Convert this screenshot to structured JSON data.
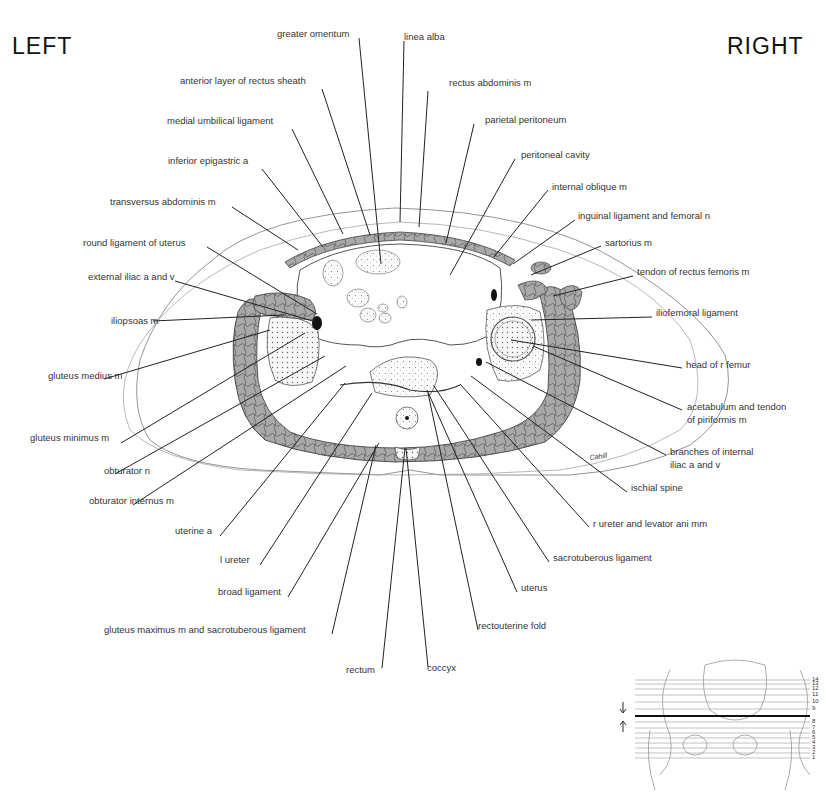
{
  "orientation": {
    "left": "LEFT",
    "right": "RIGHT"
  },
  "signature": "Cahill",
  "labels": [
    {
      "text": "greater omentum",
      "x": 277,
      "y": 34
    },
    {
      "text": "linea alba",
      "x": 404,
      "y": 37
    },
    {
      "text": "anterior layer of rectus sheath",
      "x": 180,
      "y": 81
    },
    {
      "text": "rectus abdominis m",
      "x": 449,
      "y": 83
    },
    {
      "text": "medial umbilical ligament",
      "x": 167,
      "y": 121
    },
    {
      "text": "parietal peritoneum",
      "x": 485,
      "y": 120
    },
    {
      "text": "inferior epigastric a",
      "x": 168,
      "y": 161
    },
    {
      "text": "peritoneal cavity",
      "x": 521,
      "y": 155
    },
    {
      "text": "internal oblique m",
      "x": 552,
      "y": 187
    },
    {
      "text": "transversus abdominis m",
      "x": 110,
      "y": 202
    },
    {
      "text": "inguinal ligament and femoral n",
      "x": 578,
      "y": 216
    },
    {
      "text": "sartorius m",
      "x": 605,
      "y": 243
    },
    {
      "text": "round ligament of uterus",
      "x": 83,
      "y": 243
    },
    {
      "text": "external iliac a and v",
      "x": 88,
      "y": 277
    },
    {
      "text": "tendon of rectus femoris m",
      "x": 637,
      "y": 272
    },
    {
      "text": "iliopsoas m",
      "x": 111,
      "y": 321
    },
    {
      "text": "iliofemoral ligament",
      "x": 656,
      "y": 313
    },
    {
      "text": "head of r femur",
      "x": 686,
      "y": 365
    },
    {
      "text": "gluteus medius m",
      "x": 48,
      "y": 376
    },
    {
      "text": "acetabulum and tendon",
      "x": 687,
      "y": 407
    },
    {
      "text": "of piriformis m",
      "x": 687,
      "y": 420
    },
    {
      "text": "branches of internal",
      "x": 670,
      "y": 452
    },
    {
      "text": "iliac a and v",
      "x": 670,
      "y": 465
    },
    {
      "text": "gluteus minimus m",
      "x": 30,
      "y": 438
    },
    {
      "text": "obturator n",
      "x": 104,
      "y": 471
    },
    {
      "text": "ischial spine",
      "x": 631,
      "y": 488
    },
    {
      "text": "obturator internus m",
      "x": 89,
      "y": 501
    },
    {
      "text": "r ureter and levator ani mm",
      "x": 593,
      "y": 524
    },
    {
      "text": "uterine a",
      "x": 175,
      "y": 531
    },
    {
      "text": "sacrotuberous ligament",
      "x": 553,
      "y": 558
    },
    {
      "text": "l ureter",
      "x": 220,
      "y": 560
    },
    {
      "text": "uterus",
      "x": 521,
      "y": 588
    },
    {
      "text": "broad ligament",
      "x": 218,
      "y": 592
    },
    {
      "text": "rectouterine fold",
      "x": 478,
      "y": 626
    },
    {
      "text": "gluteus maximus m and sacrotuberous ligament",
      "x": 104,
      "y": 630
    },
    {
      "text": "rectum",
      "x": 346,
      "y": 670
    },
    {
      "text": "coccyx",
      "x": 427,
      "y": 668
    }
  ],
  "leaders": [
    [
      359,
      38,
      381,
      264
    ],
    [
      404,
      41,
      400,
      222
    ],
    [
      322,
      89,
      370,
      235
    ],
    [
      428,
      91,
      419,
      227
    ],
    [
      292,
      129,
      343,
      234
    ],
    [
      474,
      124,
      446,
      243
    ],
    [
      262,
      169,
      323,
      247
    ],
    [
      515,
      159,
      450,
      275
    ],
    [
      548,
      190,
      494,
      257
    ],
    [
      232,
      207,
      298,
      250
    ],
    [
      575,
      220,
      513,
      264
    ],
    [
      601,
      246,
      531,
      275
    ],
    [
      207,
      247,
      317,
      314
    ],
    [
      175,
      281,
      316,
      322
    ],
    [
      633,
      276,
      553,
      296
    ],
    [
      153,
      321,
      284,
      315
    ],
    [
      652,
      317,
      531,
      320
    ],
    [
      682,
      368,
      511,
      340
    ],
    [
      104,
      379,
      270,
      330
    ],
    [
      682,
      410,
      533,
      346
    ],
    [
      666,
      455,
      486,
      362
    ],
    [
      121,
      443,
      305,
      333
    ],
    [
      115,
      474,
      325,
      356
    ],
    [
      627,
      492,
      471,
      376
    ],
    [
      133,
      505,
      346,
      366
    ],
    [
      589,
      527,
      460,
      384
    ],
    [
      220,
      536,
      345,
      383
    ],
    [
      549,
      562,
      434,
      386
    ],
    [
      260,
      565,
      372,
      393
    ],
    [
      517,
      592,
      427,
      390
    ],
    [
      288,
      597,
      379,
      443
    ],
    [
      478,
      630,
      428,
      393
    ],
    [
      332,
      634,
      376,
      445
    ],
    [
      382,
      668,
      405,
      448
    ],
    [
      428,
      667,
      406,
      448
    ]
  ],
  "inset": {
    "level_numbers": [
      "14",
      "13",
      "12",
      "11",
      "10",
      "9",
      "8",
      "7",
      "6",
      "5",
      "4",
      "3",
      "2",
      "1"
    ],
    "highlighted_level": "8-9"
  }
}
